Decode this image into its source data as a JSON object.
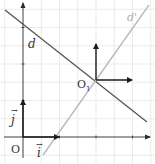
{
  "diagram": {
    "type": "coordinate-frame",
    "colors": {
      "grid": "#e4e4e4",
      "axis": "#2a2a2a",
      "line_d": "#555555",
      "line_d_prime": "#b5b5b5",
      "vector": "#1a1a1a",
      "label": "#333333"
    },
    "labels": {
      "line_d": "d",
      "line_d_prime": "d'",
      "origin": "O",
      "new_origin": "O",
      "new_origin_subscript": "1",
      "vector_i": "i",
      "vector_j": "j",
      "arrow_glyph": "→"
    },
    "grid": {
      "unit_px": 36.5,
      "origin_px": [
        23,
        137
      ]
    },
    "points": {
      "O": [
        0,
        0
      ],
      "O1": [
        2,
        1.55
      ]
    },
    "lines": [
      {
        "name": "d",
        "from_px": [
          5,
          10
        ],
        "to_px": [
          147,
          122
        ]
      },
      {
        "name": "d'",
        "from_px": [
          43,
          155
        ],
        "to_px": [
          149,
          5
        ]
      }
    ]
  }
}
